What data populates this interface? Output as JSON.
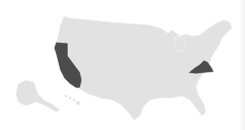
{
  "map": {
    "type": "choropleth",
    "region": "United States",
    "colors": {
      "background": "#ffffff",
      "default_state": "#e2e2e2",
      "highlighted_state": "#4b4b4b"
    },
    "highlighted_states": [
      "California",
      "Virginia"
    ],
    "insets": [
      "Alaska",
      "Hawaii"
    ]
  }
}
